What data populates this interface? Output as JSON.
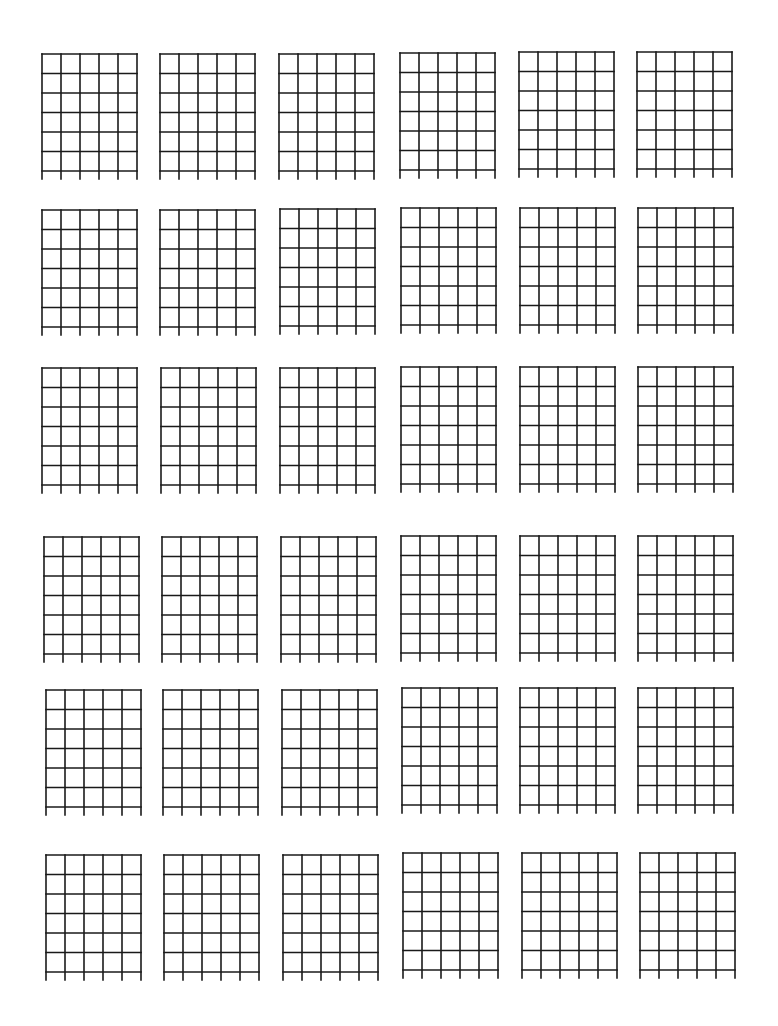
{
  "sheet": {
    "title": "",
    "grid": {
      "rows": 6,
      "columns": 6
    },
    "diagram": {
      "strings": 6,
      "fret_lines": 7,
      "width": 95,
      "height": 117,
      "string_extension_below": 8,
      "line_color": "#1a1a1a",
      "background": "#ffffff"
    },
    "rows": [
      {
        "diagrams": [
          {
            "x": 42,
            "y": 54
          },
          {
            "x": 160,
            "y": 54
          },
          {
            "x": 279,
            "y": 54
          },
          {
            "x": 400,
            "y": 53
          },
          {
            "x": 519,
            "y": 52
          },
          {
            "x": 637,
            "y": 52
          }
        ]
      },
      {
        "diagrams": [
          {
            "x": 42,
            "y": 210
          },
          {
            "x": 160,
            "y": 210
          },
          {
            "x": 280,
            "y": 209
          },
          {
            "x": 401,
            "y": 208
          },
          {
            "x": 520,
            "y": 208
          },
          {
            "x": 638,
            "y": 208
          }
        ]
      },
      {
        "diagrams": [
          {
            "x": 42,
            "y": 368
          },
          {
            "x": 161,
            "y": 368
          },
          {
            "x": 280,
            "y": 368
          },
          {
            "x": 401,
            "y": 367
          },
          {
            "x": 520,
            "y": 367
          },
          {
            "x": 638,
            "y": 367
          }
        ]
      },
      {
        "diagrams": [
          {
            "x": 44,
            "y": 537
          },
          {
            "x": 162,
            "y": 537
          },
          {
            "x": 281,
            "y": 537
          },
          {
            "x": 401,
            "y": 536
          },
          {
            "x": 520,
            "y": 536
          },
          {
            "x": 638,
            "y": 536
          }
        ]
      },
      {
        "diagrams": [
          {
            "x": 46,
            "y": 690
          },
          {
            "x": 163,
            "y": 690
          },
          {
            "x": 282,
            "y": 690
          },
          {
            "x": 402,
            "y": 688
          },
          {
            "x": 520,
            "y": 688
          },
          {
            "x": 638,
            "y": 688
          }
        ]
      },
      {
        "diagrams": [
          {
            "x": 46,
            "y": 855
          },
          {
            "x": 164,
            "y": 855
          },
          {
            "x": 283,
            "y": 855
          },
          {
            "x": 403,
            "y": 853
          },
          {
            "x": 522,
            "y": 853
          },
          {
            "x": 640,
            "y": 853
          }
        ]
      }
    ]
  }
}
